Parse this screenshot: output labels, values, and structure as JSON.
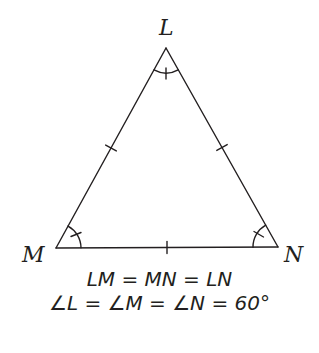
{
  "diagram": {
    "stroke_color": "#231f20",
    "background": "#ffffff",
    "vertices": [
      {
        "name": "L",
        "x": 166,
        "y": 48,
        "label": "L"
      },
      {
        "name": "M",
        "x": 56,
        "y": 248,
        "label": "M"
      },
      {
        "name": "N",
        "x": 278,
        "y": 247,
        "label": "N"
      }
    ],
    "sides": [
      {
        "from": "L",
        "to": "M",
        "tick_marks": 1
      },
      {
        "from": "M",
        "to": "N",
        "tick_marks": 1
      },
      {
        "from": "L",
        "to": "N",
        "tick_marks": 1
      }
    ],
    "angles": [
      {
        "vertex": "L",
        "arc": true,
        "tick_marks": 1
      },
      {
        "vertex": "M",
        "arc": true,
        "tick_marks": 1
      },
      {
        "vertex": "N",
        "arc": true,
        "tick_marks": 1
      }
    ],
    "captions": {
      "line1": "LM = MN = LN",
      "line2": "∠L = ∠M = ∠N = 60°"
    }
  }
}
